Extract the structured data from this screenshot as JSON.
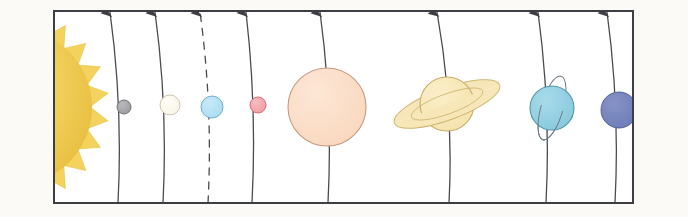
{
  "figure": {
    "page_background": "#fdfdfc",
    "frame": {
      "border_color": "#3d3d44",
      "border_width": 2,
      "x": 54,
      "y": 11,
      "width": 579,
      "height": 192,
      "fill": "#ffffff"
    },
    "scan_artifacts": {
      "left_edge_bar_color": "#3f87c8",
      "left_edge_bar_width": 9,
      "corner_mark_color": "#5aa0d8",
      "paper_tint": "#fbfaf7"
    }
  },
  "sun": {
    "name": "Sun",
    "label": "sun",
    "body_color": "#f3d25e",
    "core_color": "#f6dd80",
    "edge_color": "#e8bf42",
    "center_x": 14,
    "center_y": 107,
    "radius": 78,
    "ray_count": 22,
    "ray_length": 17,
    "clipped_by_frame": "true"
  },
  "orbits": {
    "line_color": "#4a4a52",
    "line_width": 1.3,
    "arrow_color": "#3d3d44",
    "arrow_note": "each orbit arc terminates in an upward arrowhead at the top frame border",
    "items": [
      {
        "planet": "Mercury",
        "top_x": 110,
        "bottom_x": 118,
        "style": "solid"
      },
      {
        "planet": "Venus",
        "top_x": 155,
        "bottom_x": 163,
        "style": "solid"
      },
      {
        "planet": "Earth",
        "top_x": 200,
        "bottom_x": 208,
        "style": "dashed"
      },
      {
        "planet": "Mars",
        "top_x": 246,
        "bottom_x": 252,
        "style": "solid"
      },
      {
        "planet": "Jupiter",
        "top_x": 320,
        "bottom_x": 328,
        "style": "solid"
      },
      {
        "planet": "Saturn",
        "top_x": 437,
        "bottom_x": 449,
        "style": "solid"
      },
      {
        "planet": "Uranus",
        "top_x": 538,
        "bottom_x": 546,
        "style": "solid"
      },
      {
        "planet": "Neptune",
        "top_x": 607,
        "bottom_x": 615,
        "style": "solid"
      }
    ]
  },
  "planets": [
    {
      "name": "Mercury",
      "order": 1,
      "center_x": 124,
      "center_y": 107,
      "radius": 7,
      "fill": "#9a9a9e",
      "highlight": "#b9b9bd",
      "stroke": "#6d6d72",
      "rings": "none",
      "tilt_ring": "none"
    },
    {
      "name": "Venus",
      "order": 2,
      "center_x": 170,
      "center_y": 105,
      "radius": 10,
      "fill": "#f7f3e6",
      "highlight": "#fffdf6",
      "stroke": "#c9bfa4",
      "rings": "none",
      "tilt_ring": "none"
    },
    {
      "name": "Earth",
      "order": 3,
      "center_x": 212,
      "center_y": 107,
      "radius": 11,
      "fill": "#a9dbf2",
      "highlight": "#c7e9f8",
      "stroke": "#67a9c9",
      "rings": "none",
      "tilt_ring": "none"
    },
    {
      "name": "Mars",
      "order": 4,
      "center_x": 258,
      "center_y": 105,
      "radius": 8,
      "fill": "#f09da2",
      "highlight": "#f7bcbf",
      "stroke": "#d1666d",
      "rings": "none",
      "tilt_ring": "none"
    },
    {
      "name": "Jupiter",
      "order": 5,
      "center_x": 327,
      "center_y": 107,
      "radius": 39,
      "fill": "#f9d7bd",
      "highlight": "#fde7d6",
      "stroke": "#c79a80",
      "rings": "none",
      "tilt_ring": "none"
    },
    {
      "name": "Saturn",
      "order": 6,
      "center_x": 447,
      "center_y": 104,
      "radius": 27,
      "fill": "#f5e2ab",
      "highlight": "#fbefc9",
      "stroke": "#c7ad6b",
      "rings": "broad tilted ring system",
      "ring_fill": "#f7e7b8",
      "ring_stroke": "#cdb471",
      "ring_rx": 56,
      "ring_ry": 16,
      "ring_inner_rx": 26,
      "ring_inner_ry": 6,
      "ring_rotation_deg": -20,
      "tilt_ring": "none"
    },
    {
      "name": "Uranus",
      "order": 7,
      "center_x": 552,
      "center_y": 108,
      "radius": 22,
      "fill": "#86c8dc",
      "highlight": "#a8dbea",
      "stroke": "#4f94ab",
      "rings": "thin near-vertical ring outline",
      "ring_stroke": "#6e7c84",
      "ring_rx": 33,
      "ring_ry": 11,
      "ring_rotation_deg": -74,
      "tilt_ring": "true"
    },
    {
      "name": "Neptune",
      "order": 8,
      "center_x": 619,
      "center_y": 110,
      "radius": 18,
      "fill": "#6c7cb8",
      "highlight": "#8793c7",
      "stroke": "#4b5993",
      "rings": "none",
      "tilt_ring": "none"
    }
  ]
}
